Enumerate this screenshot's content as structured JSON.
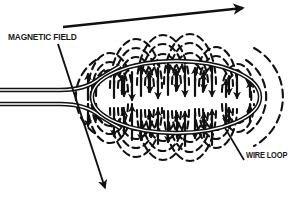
{
  "figure": {
    "background_color": "#ffffff",
    "line_color": "#111111",
    "width": 301,
    "height": 200
  },
  "labels": {
    "magnetic_field": "MAGNETIC FIELD",
    "wire_loop": "WIRE LOOP"
  },
  "annotations": {
    "field_direction_arrow": {
      "name": "field-direction-arrow",
      "description": "long straight arrow across the top pointing up and to the right"
    },
    "magnetic_field_leader": {
      "name": "magnetic-field-leader-line",
      "description": "leader line from MAGNETIC FIELD label sloping down-right ending in a downward arrowhead"
    },
    "wire_loop_leader": {
      "name": "wire-loop-leader-line",
      "description": "short leader line from WIRE LOOP label going up and to the left to the loop conductor"
    }
  },
  "elements": {
    "wire_loop": {
      "name": "wire-loop-conductor",
      "shape": "elongated horizontal ellipse drawn as a doubled conductor line",
      "center_x": 176,
      "center_y": 97,
      "radius_x": 84,
      "radius_y": 36
    },
    "lead_wires": {
      "name": "wire-leads",
      "count": 2,
      "description": "two parallel doubled conductor leads entering from the left edge and converging into the loop"
    },
    "field_lines": {
      "name": "magnetic-field-lines",
      "style": "dashed arcs with arrowheads",
      "description": "concentric dashed circular arcs encircling the conductor, above and below the loop plane, with arrowheads showing field direction"
    }
  }
}
